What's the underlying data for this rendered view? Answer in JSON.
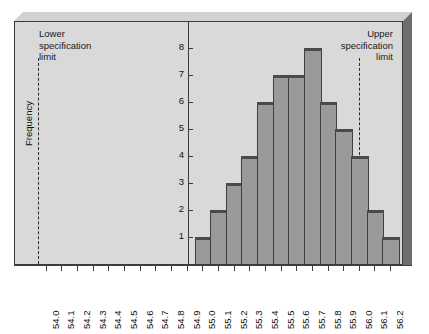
{
  "chart_data": {
    "type": "bar",
    "title": "",
    "xlabel": "",
    "ylabel": "Frequency",
    "ylim": [
      0,
      8
    ],
    "yticks": [
      1,
      2,
      3,
      4,
      5,
      6,
      7,
      8
    ],
    "grid": false,
    "legend": null,
    "categories": [
      "54.0",
      "54.1",
      "54.2",
      "54.3",
      "54.4",
      "54.5",
      "54.6",
      "54.7",
      "54.8",
      "54.9",
      "55.0",
      "55.1",
      "55.2",
      "55.3",
      "55.4",
      "55.5",
      "55.6",
      "55.7",
      "55.8",
      "55.9",
      "56.0",
      "56.1",
      "56.2"
    ],
    "values": [
      0,
      0,
      0,
      0,
      0,
      0,
      0,
      0,
      0,
      0,
      1,
      2,
      3,
      4,
      6,
      7,
      7,
      8,
      6,
      5,
      4,
      2,
      1
    ],
    "bar_categories": [
      "55.0",
      "55.1",
      "55.2",
      "55.3",
      "55.4",
      "55.5",
      "55.6",
      "55.7",
      "55.8",
      "55.9",
      "56.0",
      "56.1",
      "56.2"
    ],
    "bar_values": [
      1,
      2,
      3,
      4,
      6,
      7,
      7,
      8,
      6,
      5,
      4,
      2,
      1
    ],
    "annotations": [
      {
        "name": "lower-specification-limit",
        "text": "Lower\nspecification\nlimit",
        "x": "54.0",
        "style": "dashed-vertical-line"
      },
      {
        "name": "upper-specification-limit",
        "text": "Upper\nspecification\nlimit",
        "x": "56.05",
        "style": "dashed-vertical-line"
      }
    ]
  },
  "labels": {
    "lower_spec_line1": "Lower",
    "lower_spec_line2": "specification",
    "lower_spec_line3": "limit",
    "upper_spec_line1": "Upper",
    "upper_spec_line2": "specification",
    "upper_spec_line3": "limit",
    "y_axis_title": "Frequency"
  },
  "colors": {
    "bar_fill": "#9a9a9a",
    "bar_edge": "#3f3f3f",
    "panel_bg": "#d9d9d9",
    "frame_top": "#d2d2d2",
    "frame_right": "#6e6e6e",
    "axis": "#3c3c3c",
    "text": "#111111"
  }
}
